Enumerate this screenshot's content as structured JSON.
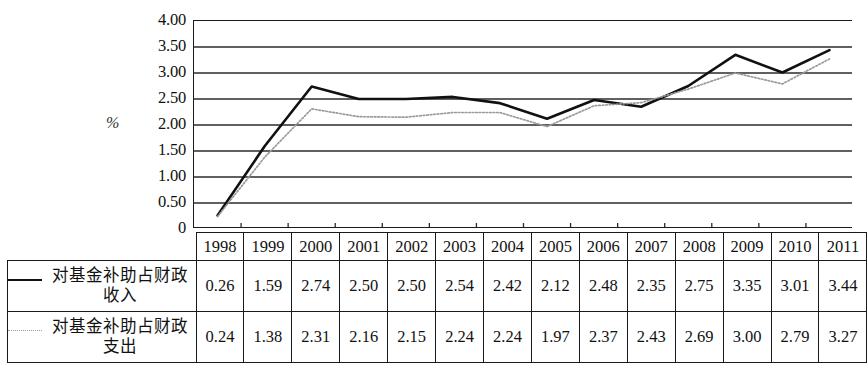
{
  "axis": {
    "unit_symbol": "%",
    "y_ticks": [
      "4.00",
      "3.50",
      "3.00",
      "2.50",
      "2.00",
      "1.50",
      "1.00",
      "0.50",
      "0"
    ]
  },
  "table": {
    "years": [
      "1998",
      "1999",
      "2000",
      "2001",
      "2002",
      "2003",
      "2004",
      "2005",
      "2006",
      "2007",
      "2008",
      "2009",
      "2010",
      "2011"
    ],
    "rows": [
      {
        "label": "对基金补助占财政收入",
        "marker": "solid-line",
        "values": [
          "0.26",
          "1.59",
          "2.74",
          "2.50",
          "2.50",
          "2.54",
          "2.42",
          "2.12",
          "2.48",
          "2.35",
          "2.75",
          "3.35",
          "3.01",
          "3.44"
        ]
      },
      {
        "label": "对基金补助占财政支出",
        "marker": "dotted-line",
        "values": [
          "0.24",
          "1.38",
          "2.31",
          "2.16",
          "2.15",
          "2.24",
          "2.24",
          "1.97",
          "2.37",
          "2.43",
          "2.69",
          "3.00",
          "2.79",
          "3.27"
        ]
      }
    ]
  },
  "chart_data": {
    "type": "line",
    "title": "",
    "xlabel": "",
    "ylabel": "%",
    "ylim": [
      0,
      4
    ],
    "y_ticks": [
      0,
      0.5,
      1.0,
      1.5,
      2.0,
      2.5,
      3.0,
      3.5,
      4.0
    ],
    "grid": true,
    "legend_position": "table-below",
    "categories": [
      "1998",
      "1999",
      "2000",
      "2001",
      "2002",
      "2003",
      "2004",
      "2005",
      "2006",
      "2007",
      "2008",
      "2009",
      "2010",
      "2011"
    ],
    "series": [
      {
        "name": "对基金补助占财政收入",
        "style": "solid",
        "color": "#111111",
        "values": [
          0.26,
          1.59,
          2.74,
          2.5,
          2.5,
          2.54,
          2.42,
          2.12,
          2.48,
          2.35,
          2.75,
          3.35,
          3.01,
          3.44
        ]
      },
      {
        "name": "对基金补助占财政支出",
        "style": "dotted",
        "color": "#9a9a9a",
        "values": [
          0.24,
          1.38,
          2.31,
          2.16,
          2.15,
          2.24,
          2.24,
          1.97,
          2.37,
          2.43,
          2.69,
          3.0,
          2.79,
          3.27
        ]
      }
    ]
  }
}
